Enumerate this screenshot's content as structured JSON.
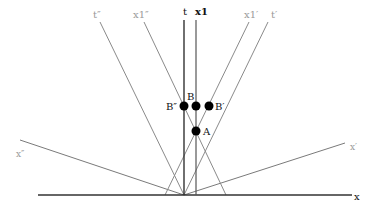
{
  "diagram": {
    "type": "spacetime-diagram",
    "colors": {
      "primary_axis": "#333333",
      "frame_line": "#8a8a8a",
      "label_primary": "#111111",
      "label_secondary": "#9a9a9a",
      "event": "#000000"
    },
    "axes": {
      "x": {
        "label": "x",
        "x1": 38,
        "y1": 195,
        "x2": 352,
        "y2": 195
      },
      "t": {
        "label": "t",
        "x1": 184,
        "y1": 20,
        "x2": 184,
        "y2": 195
      }
    },
    "worldlines": [
      {
        "id": "x1",
        "label": "x1",
        "x1": 196,
        "y1": 20,
        "x2": 196,
        "y2": 195,
        "style": "primary"
      },
      {
        "id": "x1-double-prime",
        "label": "x1″",
        "x1": 144,
        "y1": 22,
        "x2": 226,
        "y2": 195,
        "style": "secondary"
      },
      {
        "id": "x1-prime",
        "label": "x1′",
        "x1": 249,
        "y1": 22,
        "x2": 165,
        "y2": 195,
        "style": "secondary"
      }
    ],
    "frame_axes": [
      {
        "id": "t-double-prime",
        "label": "t″",
        "x1": 100,
        "y1": 22,
        "x2": 184,
        "y2": 195
      },
      {
        "id": "t-prime",
        "label": "t′",
        "x1": 268,
        "y1": 22,
        "x2": 184,
        "y2": 195
      },
      {
        "id": "x-double-prime",
        "label": "x″",
        "x1": 20,
        "y1": 140,
        "x2": 184,
        "y2": 195
      },
      {
        "id": "x-prime",
        "label": "x′",
        "x1": 345,
        "y1": 143,
        "x2": 184,
        "y2": 195
      }
    ],
    "events": [
      {
        "id": "B-double-prime",
        "label": "B″",
        "cx": 184,
        "cy": 106
      },
      {
        "id": "B",
        "label": "B",
        "cx": 196,
        "cy": 106
      },
      {
        "id": "B-prime",
        "label": "B′",
        "cx": 209,
        "cy": 106
      },
      {
        "id": "A",
        "label": "A",
        "cx": 196,
        "cy": 131
      }
    ]
  }
}
